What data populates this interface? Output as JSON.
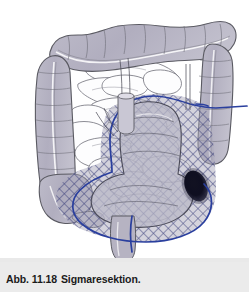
{
  "figure": {
    "caption_label": "Abb. 11.18",
    "caption_title": "Sigmaresektion.",
    "caption_full": "Abb. 11.18  Sigmaresektion."
  },
  "colors": {
    "background": "#ffffff",
    "caption_band": "#e9e9e9",
    "caption_text": "#1b1b1b",
    "colon_fill": "#b3b0bf",
    "colon_fill_light": "#c3c1ce",
    "colon_outline": "#5a5a62",
    "small_bowel_fill": "#fdfdfe",
    "small_bowel_outline": "#6f6f78",
    "resection_line": "#2a3f9e",
    "mesh_hatch": "#3a3f7a",
    "mesh_fill": "#9d9ab1",
    "tumor": "#0d0d1c",
    "rectum_fill": "#b6b3c2"
  },
  "anatomy": {
    "parts": [
      {
        "name": "transverse-colon",
        "label": "Colon transversum"
      },
      {
        "name": "ascending-colon",
        "label": "Colon ascendens"
      },
      {
        "name": "descending-colon",
        "label": "Colon descendens"
      },
      {
        "name": "cecum",
        "label": "Caecum"
      },
      {
        "name": "appendix",
        "label": "Appendix vermiformis"
      },
      {
        "name": "small-intestine",
        "label": "Intestinum tenue"
      },
      {
        "name": "sigmoid-colon",
        "label": "Colon sigmoideum"
      },
      {
        "name": "rectum",
        "label": "Rectum"
      },
      {
        "name": "tumor-lesion",
        "label": "Tumor"
      },
      {
        "name": "resection-boundary",
        "label": "Resektionsgrenze"
      },
      {
        "name": "mesentery-resection-zone",
        "label": "Mesenterium Resektionszone"
      }
    ]
  }
}
